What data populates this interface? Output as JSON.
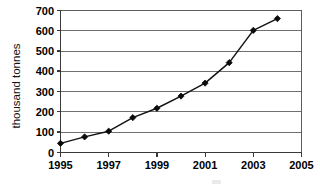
{
  "chart_data": {
    "type": "line",
    "title": "",
    "xlabel": "",
    "ylabel": "thousand tonnes",
    "x": [
      1995,
      1996,
      1997,
      1998,
      1999,
      2000,
      2001,
      2002,
      2003,
      2004
    ],
    "values": [
      45,
      77,
      105,
      172,
      218,
      278,
      342,
      443,
      602,
      660
    ],
    "series": [
      {
        "name": "thousand tonnes",
        "values": [
          45,
          77,
          105,
          172,
          218,
          278,
          342,
          443,
          602,
          660
        ]
      }
    ],
    "xlim": [
      1995,
      2005
    ],
    "ylim": [
      0,
      700
    ],
    "ytick_labels": [
      "0",
      "100",
      "200",
      "300",
      "400",
      "500",
      "600",
      "700"
    ],
    "ytick_values": [
      0,
      100,
      200,
      300,
      400,
      500,
      600,
      700
    ],
    "xtick_labels": [
      "1995",
      "1997",
      "1999",
      "2001",
      "2003",
      "2005"
    ],
    "xtick_values": [
      1995,
      1997,
      1999,
      2001,
      2003,
      2005
    ],
    "grid": "horizontal",
    "legend": "none",
    "marker": "diamond",
    "line_color": "#141414",
    "grid_color": "#6f6f6f",
    "background": "#ffffff"
  }
}
